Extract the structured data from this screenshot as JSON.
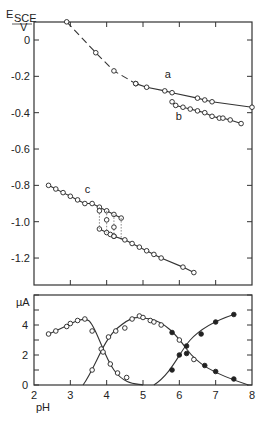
{
  "chart_data": [
    {
      "type": "line",
      "panel": "upper",
      "ylabel": "E",
      "ylabel_sub": "SCE",
      "ylabel_unit": "V",
      "xlabel": "pH",
      "xlim": [
        2,
        8
      ],
      "ylim": [
        -1.35,
        0.1
      ],
      "yticks": [
        0,
        -0.2,
        -0.4,
        -0.6,
        -0.8,
        -1.0,
        -1.2
      ],
      "ytick_labels": [
        "0",
        "-0.2",
        "-0.4",
        "-0.6",
        "-0.8",
        "-1.0",
        "-1.2"
      ],
      "xticks": [
        2,
        3,
        4,
        5,
        6,
        7,
        8
      ],
      "series": [
        {
          "name": "a (dashed)",
          "style": "dashed",
          "x": [
            2.9,
            3.7,
            4.2,
            4.8
          ],
          "y": [
            0.1,
            -0.07,
            -0.17,
            -0.24
          ]
        },
        {
          "name": "a",
          "label": "a",
          "style": "solid",
          "x": [
            4.8,
            5.1,
            5.6,
            5.8,
            6.5,
            6.7,
            6.9,
            8.0
          ],
          "y": [
            -0.24,
            -0.26,
            -0.28,
            -0.29,
            -0.32,
            -0.33,
            -0.34,
            -0.37
          ]
        },
        {
          "name": "b",
          "label": "b",
          "style": "solid",
          "x": [
            5.8,
            5.9,
            6.1,
            6.3,
            6.5,
            6.7,
            6.9,
            7.1,
            7.2,
            7.4,
            7.7
          ],
          "y": [
            -0.34,
            -0.36,
            -0.37,
            -0.38,
            -0.39,
            -0.4,
            -0.42,
            -0.43,
            -0.43,
            -0.44,
            -0.46
          ]
        },
        {
          "name": "c upper",
          "label": "c",
          "style": "solid",
          "x": [
            2.4,
            2.6,
            2.8,
            3.0,
            3.2,
            3.4,
            3.6,
            3.8,
            4.0,
            4.2,
            4.4
          ],
          "y": [
            -0.8,
            -0.82,
            -0.84,
            -0.86,
            -0.88,
            -0.9,
            -0.9,
            -0.92,
            -0.94,
            -0.96,
            -0.98
          ]
        },
        {
          "name": "c intermediate",
          "style": "points",
          "x": [
            3.8,
            4.0,
            4.2,
            4.2
          ],
          "y": [
            -0.94,
            -0.99,
            -1.03,
            -1.08
          ]
        },
        {
          "name": "c lower",
          "style": "solid",
          "x": [
            3.8,
            4.0,
            4.1,
            4.2,
            4.5,
            4.7,
            4.9,
            5.1,
            5.3,
            5.5,
            6.1,
            6.4
          ],
          "y": [
            -1.04,
            -1.06,
            -1.07,
            -1.08,
            -1.1,
            -1.12,
            -1.14,
            -1.16,
            -1.18,
            -1.2,
            -1.25,
            -1.28
          ]
        }
      ]
    },
    {
      "type": "line",
      "panel": "lower",
      "ylabel": "µA",
      "xlabel": "pH",
      "xlim": [
        2,
        8
      ],
      "ylim": [
        0,
        6
      ],
      "yticks": [
        0,
        2,
        4
      ],
      "xticks": [
        2,
        3,
        4,
        5,
        6,
        7,
        8
      ],
      "xtick_labels": [
        "2",
        "3",
        "4",
        "5",
        "6",
        "7",
        "8"
      ],
      "series": [
        {
          "name": "wave 1 (open)",
          "marker": "open",
          "x": [
            2.4,
            2.6,
            2.9,
            3.0,
            3.2,
            3.4,
            3.6,
            3.8,
            4.0,
            4.3,
            4.6
          ],
          "y": [
            3.4,
            3.6,
            3.9,
            4.1,
            4.3,
            4.4,
            3.6,
            2.4,
            1.4,
            0.8,
            0.4
          ]
        },
        {
          "name": "wave 2 (open)",
          "marker": "open",
          "x": [
            3.6,
            3.8,
            4.0,
            4.2,
            4.5,
            4.7,
            4.9,
            5.0,
            5.2,
            5.5,
            6.0,
            6.4
          ],
          "y": [
            1.0,
            2.4,
            3.2,
            3.6,
            3.9,
            4.4,
            4.6,
            4.5,
            4.3,
            4.0,
            3.0,
            1.7
          ]
        },
        {
          "name": "wave 3 (filled)",
          "marker": "filled",
          "x": [
            5.8,
            6.0,
            6.2,
            6.6,
            7.0,
            7.5
          ],
          "y": [
            1.0,
            2.0,
            2.6,
            3.4,
            4.2,
            4.7
          ]
        },
        {
          "name": "wave 2 tail (filled)",
          "marker": "filled",
          "x": [
            5.8,
            6.2,
            6.7,
            7.0,
            7.5
          ],
          "y": [
            3.5,
            2.1,
            1.3,
            0.9,
            0.4
          ]
        }
      ]
    }
  ],
  "labels": {
    "y_upper_main": "E",
    "y_upper_sub": "SCE",
    "y_upper_unit": "V",
    "y_lower": "µA",
    "x": "pH",
    "curve_a": "a",
    "curve_b": "b",
    "curve_c": "c",
    "upper_ticks": [
      "0",
      "-0.2",
      "-0.4",
      "-0.6",
      "-0.8",
      "-1.0",
      "-1.2"
    ],
    "lower_ticks": [
      "0",
      "2",
      "4"
    ],
    "x_ticks": [
      "2",
      "3",
      "4",
      "5",
      "6",
      "7",
      "8"
    ]
  }
}
